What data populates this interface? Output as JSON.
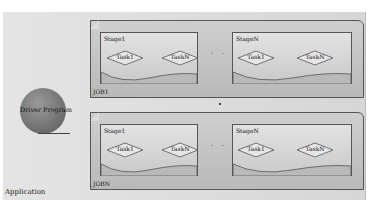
{
  "diagram": {
    "application_label": "Application",
    "driver_label": "Driver Program",
    "ellipsis": "· ·",
    "jobs": [
      {
        "label": "JOB1",
        "stages": [
          {
            "label": "Stage1",
            "tasks": [
              "Task1",
              "TaskN"
            ]
          },
          {
            "label": "StageN",
            "tasks": [
              "Task1",
              "TaskN"
            ]
          }
        ]
      },
      {
        "label": "JOBN",
        "stages": [
          {
            "label": "Stage1",
            "tasks": [
              "Task1",
              "TaskN"
            ]
          },
          {
            "label": "StageN",
            "tasks": [
              "Task1",
              "TaskN"
            ]
          }
        ]
      }
    ],
    "colors": {
      "background": "#e0e0e0",
      "job_fill": "#c4c4c4",
      "stage_fill": "#d8d8d8",
      "task_fill": "#e6e6e6",
      "driver_fill": "#7a7a7a",
      "stroke": "#555555"
    }
  }
}
